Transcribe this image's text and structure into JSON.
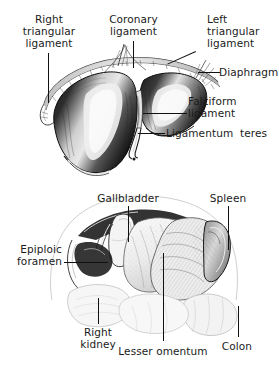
{
  "figure": {
    "background_color": "#ffffff",
    "ink_color": "#111111",
    "label_color": "#1b1b1b",
    "panels": [
      {
        "id": "upper",
        "name": "liver-anterior-view",
        "description": "Anterior view of the liver showing right and left lobes with peritoneal ligaments and diaphragm reflections"
      },
      {
        "id": "lower",
        "name": "upper-abdominal-viscera-view",
        "description": "Upper abdominal viscera with liver retracted showing gallbladder, lesser omentum, spleen, colon, right kidney and epiploic foramen"
      }
    ]
  },
  "labels": {
    "right_triangular_ligament": "Right\ntriangular\nligament",
    "coronary_ligament": "Coronary\nligament",
    "left_triangular_ligament": "Left\ntriangular\nligament",
    "diaphragm": "Diaphragm",
    "falciform_ligament": "Falciform\nligament",
    "ligamentum_teres": "Ligamentum  teres",
    "gallbladder": "Gallbladder",
    "spleen": "Spleen",
    "epiploic_foramen": "Epiploic\nforamen",
    "right_kidney": "Right\nkidney",
    "lesser_omentum": "Lesser omentum",
    "colon": "Colon"
  }
}
